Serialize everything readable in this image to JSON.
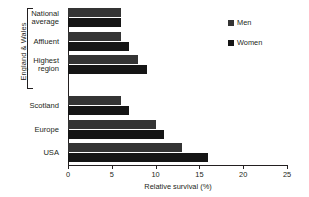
{
  "chart_data": {
    "type": "bar",
    "orientation": "horizontal",
    "title": "",
    "xlabel": "Relative survival (%)",
    "ylabel": "",
    "xlim": [
      0,
      25
    ],
    "xticks": [
      "0",
      "5",
      "10",
      "15",
      "20",
      "25"
    ],
    "grid": false,
    "legend_position": "top-right",
    "group_label": "England & Wales",
    "categories": [
      "National\naverage",
      "Affluent",
      "Highest\nregion",
      "Scotland",
      "Europe",
      "USA"
    ],
    "series": [
      {
        "name": "Men",
        "color": "#343434",
        "values": [
          6,
          6,
          8,
          6,
          10,
          13
        ]
      },
      {
        "name": "Women",
        "color": "#151515",
        "values": [
          6,
          7,
          9,
          7,
          11,
          16
        ]
      }
    ]
  },
  "legend": {
    "items": [
      {
        "label": "Men",
        "color": "#343434"
      },
      {
        "label": "Women",
        "color": "#151515"
      }
    ]
  }
}
